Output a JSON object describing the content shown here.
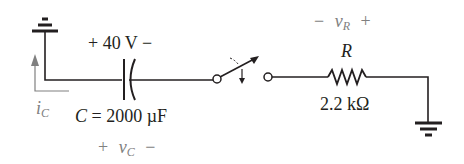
{
  "diagram": {
    "type": "RC discharge circuit",
    "capacitor": {
      "voltage_label": "+ 40 V −",
      "value_symbol": "C",
      "value_eq": " = 2000 µF",
      "vc_plus": "+",
      "vc_symbol": "v",
      "vc_sub": "C",
      "vc_minus": "−"
    },
    "current": {
      "symbol": "i",
      "sub": "C"
    },
    "resistor": {
      "symbol": "R",
      "value": "2.2 kΩ",
      "vr_minus": "−",
      "vr_symbol": "v",
      "vr_sub": "R",
      "vr_plus": "+"
    },
    "switch": {
      "state": "closing"
    },
    "colors": {
      "wire": "#231f20",
      "annotation": "#808080"
    }
  }
}
